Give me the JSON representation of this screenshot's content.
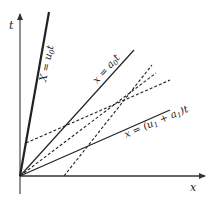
{
  "diagram": {
    "type": "space-time characteristic diagram",
    "axes": {
      "x_label": "x",
      "t_label": "t"
    },
    "solid_lines": [
      {
        "id": "line-u0",
        "label": "X = u₀t",
        "label_parts": [
          "X = u",
          "0",
          "t"
        ]
      },
      {
        "id": "line-a0",
        "label": "x = a₀t",
        "label_parts": [
          "x = a",
          "0",
          "t"
        ]
      },
      {
        "id": "line-u1a1",
        "label": "x = (u₁ + a₁)t",
        "label_parts": [
          "x = (u",
          "1",
          " + a",
          "1",
          ")t"
        ]
      }
    ],
    "dashed_lines": [
      {
        "id": "dashed-1",
        "from": "t-axis",
        "description": "starts on t-axis, passes through common point"
      },
      {
        "id": "dashed-2",
        "from": "origin",
        "description": "starts at origin, passes through common point"
      },
      {
        "id": "dashed-3",
        "from": "x-axis",
        "description": "starts on x-axis, passes through common point"
      }
    ],
    "colors": {
      "line": "#222222",
      "axis": "#555555",
      "background": "#ffffff"
    }
  }
}
